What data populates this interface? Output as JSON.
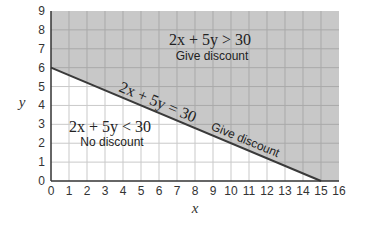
{
  "chart_data": {
    "type": "area",
    "title": "",
    "xlabel": "x",
    "ylabel": "y",
    "xlim": [
      0,
      16
    ],
    "ylim": [
      0,
      9
    ],
    "x_ticks": [
      "0",
      "1",
      "2",
      "3",
      "4",
      "5",
      "6",
      "7",
      "8",
      "9",
      "10",
      "11",
      "12",
      "13",
      "14",
      "15",
      "16"
    ],
    "y_ticks": [
      "0",
      "1",
      "2",
      "3",
      "4",
      "5",
      "6",
      "7",
      "8",
      "9"
    ],
    "grid": true,
    "boundary_line": {
      "equation": "2x + 5y = 30",
      "points": [
        [
          0,
          6
        ],
        [
          15,
          0
        ]
      ],
      "label": "2x + 5y = 30",
      "label_suffix": "Give discount"
    },
    "regions": [
      {
        "name": "above",
        "inequality": "2x + 5y > 30",
        "label": "Give discount",
        "shaded": true,
        "color": "#c8c8c8"
      },
      {
        "name": "below",
        "inequality": "2x + 5y < 30",
        "label": "No discount",
        "shaded": false,
        "color": "#ffffff"
      }
    ]
  },
  "labels": {
    "upper_ineq": "2x + 5y > 30",
    "upper_sub": "Give discount",
    "lower_ineq": "2x + 5y < 30",
    "lower_sub": "No discount",
    "line_eq": "2x + 5y = 30",
    "line_sub": "Give discount",
    "xlabel": "x",
    "ylabel": "y"
  },
  "colors": {
    "shade": "#c8c8c8",
    "grid_shaded": "#a9a9a9",
    "grid_white": "#c9c9c9",
    "line": "#3a3a3a",
    "axis": "#333333"
  }
}
